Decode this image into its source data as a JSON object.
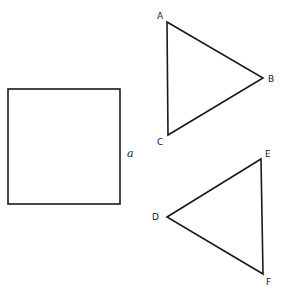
{
  "figure": {
    "square": {
      "side_label": "a",
      "x": 8,
      "y": 89,
      "width": 112,
      "height": 115
    },
    "triangle_abc": {
      "vertices": {
        "A": {
          "label": "A",
          "x": 167,
          "y": 22
        },
        "B": {
          "label": "B",
          "x": 263,
          "y": 78
        },
        "C": {
          "label": "C",
          "x": 168,
          "y": 135
        }
      }
    },
    "triangle_def": {
      "vertices": {
        "D": {
          "label": "D",
          "x": 167,
          "y": 217
        },
        "E": {
          "label": "E",
          "x": 261,
          "y": 159
        },
        "F": {
          "label": "F",
          "x": 263,
          "y": 274
        }
      }
    },
    "colors": {
      "stroke": "#1a1a1a",
      "background": "#ffffff"
    }
  }
}
